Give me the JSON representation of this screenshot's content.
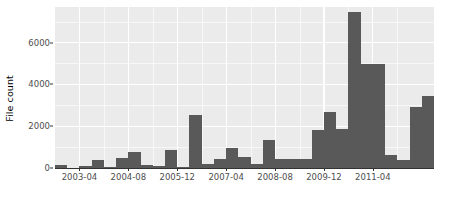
{
  "chart_data": {
    "type": "bar",
    "title": "",
    "subtitle": "",
    "xlabel": "",
    "ylabel": "File count",
    "ylim": [
      0,
      7700
    ],
    "xlim": [
      "2002-08",
      "2012-04"
    ],
    "grid": true,
    "legend": null,
    "bar_color": "#595959",
    "panel_color": "#ebebeb",
    "grid_color": "#ffffff",
    "y_ticks": [
      0,
      2000,
      4000,
      6000
    ],
    "y_tick_labels": [
      "0",
      "2000",
      "4000",
      "6000"
    ],
    "y_minor_ticks": [
      1000,
      3000,
      5000,
      7000
    ],
    "x_ticks": [
      "2003-04",
      "2004-08",
      "2005-12",
      "2007-04",
      "2008-08",
      "2009-12",
      "2011-04"
    ],
    "x_tick_labels": [
      "2003-04",
      "2004-08",
      "2005-12",
      "2007-04",
      "2008-08",
      "2009-12",
      "2011-04"
    ],
    "x_minor_ticks": [
      "2003-12",
      "2005-04",
      "2006-08",
      "2007-12",
      "2009-04",
      "2010-08",
      "2011-12"
    ],
    "bin_width_months": 4,
    "categories": [
      "2002-08",
      "2002-12",
      "2003-04",
      "2003-08",
      "2003-12",
      "2004-04",
      "2004-08",
      "2004-12",
      "2005-04",
      "2005-08",
      "2005-12",
      "2006-04",
      "2006-08",
      "2006-12",
      "2007-04",
      "2007-08",
      "2007-12",
      "2008-04",
      "2008-08",
      "2008-12",
      "2009-04",
      "2009-08",
      "2009-12",
      "2010-04",
      "2010-08",
      "2010-12",
      "2011-04",
      "2011-08",
      "2011-12"
    ],
    "values": [
      160,
      0,
      120,
      370,
      60,
      480,
      750,
      140,
      120,
      850,
      60,
      2530,
      170,
      410,
      950,
      540,
      180,
      1320,
      420,
      430,
      420,
      1800,
      2680,
      1870,
      7450,
      4960,
      4980,
      620,
      400
    ],
    "series": [
      {
        "name": "File count",
        "values": [
          160,
          0,
          120,
          370,
          60,
          480,
          750,
          140,
          120,
          850,
          60,
          2530,
          170,
          410,
          950,
          540,
          180,
          1320,
          420,
          430,
          420,
          1800,
          2680,
          1870,
          7450,
          4960,
          4980,
          620,
          400
        ]
      }
    ],
    "extra_bars": [
      {
        "label": "2012-00",
        "value": 2910
      },
      {
        "label": "2012-04",
        "value": 3430
      }
    ]
  }
}
